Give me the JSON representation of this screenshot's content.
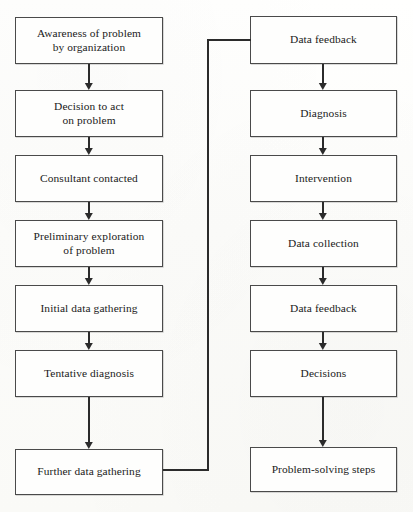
{
  "diagram": {
    "line_color": "#2b2b2b",
    "box_border_color": "#4a4a4a",
    "background_color": "#fdfdfb",
    "left_column": [
      {
        "id": "awareness",
        "label": "Awareness of problem\nby organization"
      },
      {
        "id": "decision-to-act",
        "label": "Decision to act\non problem"
      },
      {
        "id": "consultant",
        "label": "Consultant contacted"
      },
      {
        "id": "preliminary",
        "label": "Preliminary exploration\nof problem"
      },
      {
        "id": "initial-data",
        "label": "Initial data gathering"
      },
      {
        "id": "tentative",
        "label": "Tentative diagnosis"
      },
      {
        "id": "further-data",
        "label": "Further data gathering"
      }
    ],
    "right_column": [
      {
        "id": "data-feedback-1",
        "label": "Data feedback"
      },
      {
        "id": "diagnosis",
        "label": "Diagnosis"
      },
      {
        "id": "intervention",
        "label": "Intervention"
      },
      {
        "id": "data-collection",
        "label": "Data collection"
      },
      {
        "id": "data-feedback-2",
        "label": "Data feedback"
      },
      {
        "id": "decisions",
        "label": "Decisions"
      },
      {
        "id": "problem-solving",
        "label": "Problem-solving steps"
      }
    ],
    "connector": {
      "id": "feedback-loop",
      "from": "further-data",
      "to": "data-feedback-1",
      "description": "Loop from Further data gathering back up to Data feedback"
    }
  }
}
